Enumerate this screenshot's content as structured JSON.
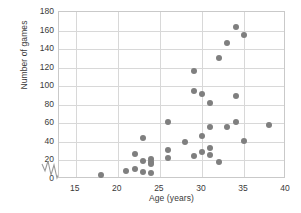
{
  "chart_data": {
    "type": "scatter",
    "title": "",
    "xlabel": "Age (years)",
    "ylabel": "Number of games",
    "xlim": [
      13,
      40
    ],
    "ylim": [
      0,
      180
    ],
    "xticks": [
      15,
      20,
      25,
      30,
      35,
      40
    ],
    "yticks": [
      0,
      20,
      40,
      60,
      80,
      100,
      120,
      140,
      160,
      180
    ],
    "grid": true,
    "legend": "none",
    "axis_break": {
      "axis": "x",
      "symbol": "zigzag",
      "between": [
        13,
        15
      ]
    },
    "marker": {
      "shape": "circle",
      "color": "#7f7f7f",
      "size": 6
    },
    "points": [
      {
        "x": 18,
        "y": 4
      },
      {
        "x": 21,
        "y": 9
      },
      {
        "x": 22,
        "y": 27
      },
      {
        "x": 22,
        "y": 11
      },
      {
        "x": 23,
        "y": 19
      },
      {
        "x": 23,
        "y": 8
      },
      {
        "x": 23,
        "y": 44
      },
      {
        "x": 24,
        "y": 22
      },
      {
        "x": 24,
        "y": 18
      },
      {
        "x": 24,
        "y": 16
      },
      {
        "x": 24,
        "y": 6
      },
      {
        "x": 26,
        "y": 61
      },
      {
        "x": 26,
        "y": 31
      },
      {
        "x": 26,
        "y": 23
      },
      {
        "x": 28,
        "y": 40
      },
      {
        "x": 29,
        "y": 116
      },
      {
        "x": 29,
        "y": 95
      },
      {
        "x": 29,
        "y": 25
      },
      {
        "x": 30,
        "y": 92
      },
      {
        "x": 30,
        "y": 46
      },
      {
        "x": 30,
        "y": 29
      },
      {
        "x": 31,
        "y": 82
      },
      {
        "x": 31,
        "y": 56
      },
      {
        "x": 31,
        "y": 33
      },
      {
        "x": 31,
        "y": 26
      },
      {
        "x": 32,
        "y": 130
      },
      {
        "x": 32,
        "y": 18
      },
      {
        "x": 33,
        "y": 147
      },
      {
        "x": 33,
        "y": 56
      },
      {
        "x": 34,
        "y": 164
      },
      {
        "x": 34,
        "y": 89
      },
      {
        "x": 34,
        "y": 61
      },
      {
        "x": 35,
        "y": 155
      },
      {
        "x": 35,
        "y": 41
      },
      {
        "x": 38,
        "y": 58
      }
    ]
  }
}
